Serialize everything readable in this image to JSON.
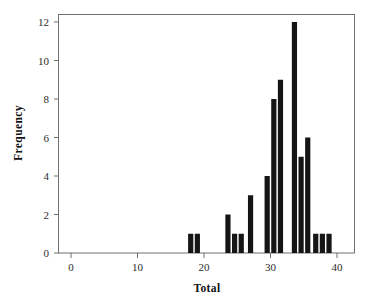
{
  "chart_data": {
    "type": "bar",
    "title": "",
    "subtitle": "",
    "xlabel": "Total",
    "ylabel": "Frequency",
    "xlim": [
      -2,
      42
    ],
    "ylim": [
      0,
      12.6
    ],
    "xticks": [
      0,
      10,
      20,
      30,
      40
    ],
    "xtick_labels": [
      "0",
      "10",
      "20",
      "30",
      "40"
    ],
    "yticks": [
      0,
      2,
      4,
      6,
      8,
      10,
      12
    ],
    "ytick_labels": [
      "0",
      "2",
      "4",
      "6",
      "8",
      "10",
      "12"
    ],
    "grid": false,
    "legend": null,
    "bar_color": "#151515",
    "bin_width": 1,
    "x": [
      18,
      19,
      24,
      25,
      26,
      27,
      30,
      31,
      32,
      34,
      35,
      36,
      37,
      38,
      39
    ],
    "values": [
      1,
      1,
      2,
      1,
      1,
      3,
      4,
      8,
      9,
      12,
      5,
      6,
      1,
      1,
      1
    ],
    "bars": [
      {
        "center": 18.0,
        "value": 1
      },
      {
        "center": 19.0,
        "value": 1
      },
      {
        "center": 23.6,
        "value": 2
      },
      {
        "center": 24.6,
        "value": 1
      },
      {
        "center": 25.6,
        "value": 1
      },
      {
        "center": 27.0,
        "value": 3
      },
      {
        "center": 29.5,
        "value": 4
      },
      {
        "center": 30.5,
        "value": 8
      },
      {
        "center": 31.5,
        "value": 9
      },
      {
        "center": 33.6,
        "value": 12
      },
      {
        "center": 34.6,
        "value": 5
      },
      {
        "center": 35.6,
        "value": 6
      },
      {
        "center": 36.8,
        "value": 1
      },
      {
        "center": 37.8,
        "value": 1
      },
      {
        "center": 38.8,
        "value": 1
      }
    ],
    "total_count": 52,
    "annotations": []
  },
  "axes": {
    "x_axis_title": "Total",
    "y_axis_title": "Frequency"
  }
}
